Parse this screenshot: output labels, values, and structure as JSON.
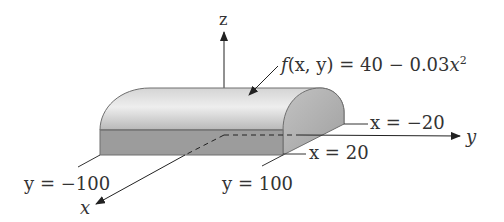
{
  "figure": {
    "axes": {
      "x_label": "x",
      "y_label": "y",
      "z_label": "z"
    },
    "surface_label": {
      "f": "f",
      "args": "(x, y)",
      "eq": " = 40 − 0.03",
      "var": "x",
      "exp": "2"
    },
    "bounds": {
      "x_neg": "x = −20",
      "x_pos": "x = 20",
      "y_neg": "y = −100",
      "y_pos": "y = 100"
    },
    "colors": {
      "top_surface_light": "#e6e6e6",
      "top_surface_dark": "#b5b5b5",
      "side_face": "#a8a8a8",
      "front_face": "#9c9c9c",
      "outline": "#6e6e6e",
      "axis": "#222222"
    }
  }
}
